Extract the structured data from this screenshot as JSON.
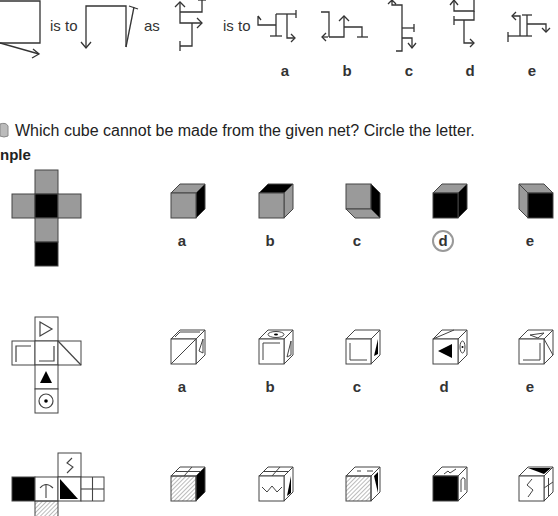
{
  "analogy": {
    "connector1": "is to",
    "connector2": "as",
    "connector3": "is to",
    "option_labels": [
      "a",
      "b",
      "c",
      "d",
      "e"
    ]
  },
  "instruction": {
    "icon": "pencil-icon",
    "text": "Which cube cannot be made from the given net? Circle the letter."
  },
  "example": {
    "heading": "nple",
    "net": {
      "description": "cross net: grey top, grey left, black centre, grey right, grey below, black bottom"
    },
    "option_labels": [
      "a",
      "b",
      "c",
      "d",
      "e"
    ],
    "circled_answer": "d",
    "colors": {
      "grey": "#9a9a9a",
      "black": "#000000",
      "circle": "#999999"
    }
  },
  "question1": {
    "net": {
      "faces": [
        "outline-triangle-right",
        "corner-top-left",
        "corner-bottom-right",
        "diagonal",
        "black-triangle-up",
        "dot-in-circle"
      ]
    },
    "option_labels": [
      "a",
      "b",
      "c",
      "d",
      "e"
    ]
  },
  "question2": {
    "net": {
      "faces": [
        "zigzag",
        "black",
        "T-shape",
        "black-triangle",
        "grid-4",
        "hatched"
      ]
    }
  }
}
